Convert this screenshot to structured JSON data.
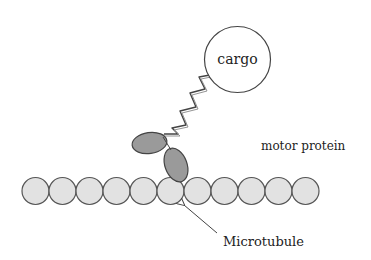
{
  "diagram": {
    "type": "schematic",
    "labels": {
      "cargo": "cargo",
      "motor_protein": "motor protein",
      "microtubule": "Microtubule"
    },
    "microtubule": {
      "subunit_count": 11,
      "subunit_fill": "#e2e2e2",
      "subunit_stroke": "#555555"
    },
    "motor_heads": {
      "count": 2,
      "fill": "#9a9a9a",
      "stroke": "#444444"
    },
    "cargo": {
      "fill": "#ffffff",
      "stroke": "#444444"
    },
    "colors": {
      "background": "#ffffff",
      "text": "#222222",
      "line": "#444444"
    }
  }
}
